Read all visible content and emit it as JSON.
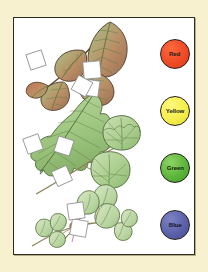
{
  "page": {
    "kind": "worksheet-plate",
    "mount_color": "#f7f1cf",
    "panel_color": "#ffffff",
    "panel_border_color": "#2f2b22"
  },
  "swatches": [
    {
      "name": "red",
      "label": "Red",
      "fill": "#f04a26",
      "outline": "#241f1a",
      "text_color": "#1d1b17"
    },
    {
      "name": "yellow",
      "label": "Yellow",
      "fill": "#f5ee4a",
      "outline": "#241f1a",
      "text_color": "#1d1b17"
    },
    {
      "name": "green",
      "label": "Green",
      "fill": "#5cb63b",
      "outline": "#241f1a",
      "text_color": "#14240d"
    },
    {
      "name": "blue",
      "label": "Blue",
      "fill": "#5a61a8",
      "outline": "#241f1a",
      "text_color": "#15131f"
    }
  ],
  "illustration": {
    "caption": "",
    "specimens": [
      {
        "name": "bramble-compound-leaf",
        "tone": "red-brown and green",
        "leaflets": 5
      },
      {
        "name": "dandelion-lobed-leaf",
        "tone": "green",
        "leaflets": 1
      },
      {
        "name": "mallow-round-leaves",
        "tone": "green",
        "leaflets": 3
      },
      {
        "name": "clover-trifoliate",
        "tone": "green",
        "leaflets": 9
      }
    ],
    "answer_boxes": 9,
    "answer_box_fill": "#ffffff",
    "answer_box_stroke": "#8d8d8d"
  }
}
